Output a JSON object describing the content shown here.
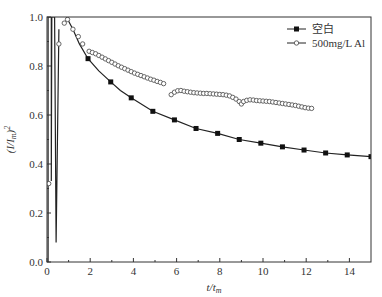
{
  "chart_data": {
    "type": "line",
    "title": "",
    "xlabel": "t/t",
    "xlabel_sub": "m",
    "ylabel": "(I/I",
    "ylabel_sub": "m",
    "ylabel_sup": "2",
    "xlim": [
      0,
      15
    ],
    "ylim": [
      0.0,
      1.0
    ],
    "xticks": [
      0,
      2,
      4,
      6,
      8,
      10,
      12,
      14
    ],
    "xtick_labels": [
      "0",
      "2",
      "4",
      "6",
      "8",
      "10",
      "12",
      "14"
    ],
    "yticks": [
      0.0,
      0.2,
      0.4,
      0.6,
      0.8,
      1.0
    ],
    "ytick_labels": [
      "0.0",
      "0.2",
      "0.4",
      "0.6",
      "0.8",
      "1.0"
    ],
    "grid": false,
    "legend_position": "upper right",
    "series": [
      {
        "name": "空白",
        "marker": "filled-square",
        "line": "solid-curve",
        "points": [
          [
            1.9,
            0.83
          ],
          [
            2.95,
            0.735
          ],
          [
            3.9,
            0.67
          ],
          [
            4.9,
            0.615
          ],
          [
            5.9,
            0.58
          ],
          [
            6.9,
            0.545
          ],
          [
            7.9,
            0.525
          ],
          [
            8.9,
            0.5
          ],
          [
            9.9,
            0.485
          ],
          [
            10.9,
            0.47
          ],
          [
            11.9,
            0.457
          ],
          [
            12.9,
            0.445
          ],
          [
            13.9,
            0.437
          ],
          [
            15.0,
            0.43
          ]
        ],
        "curve": [
          [
            0.9,
            1.0
          ],
          [
            1.2,
            0.95
          ],
          [
            1.5,
            0.89
          ],
          [
            1.9,
            0.83
          ],
          [
            2.4,
            0.78
          ],
          [
            2.95,
            0.735
          ],
          [
            3.4,
            0.7
          ],
          [
            3.9,
            0.67
          ],
          [
            4.9,
            0.615
          ],
          [
            5.9,
            0.58
          ],
          [
            6.9,
            0.545
          ],
          [
            7.9,
            0.525
          ],
          [
            8.9,
            0.5
          ],
          [
            9.9,
            0.485
          ],
          [
            10.9,
            0.47
          ],
          [
            11.9,
            0.457
          ],
          [
            12.9,
            0.445
          ],
          [
            13.9,
            0.437
          ],
          [
            15.0,
            0.43
          ]
        ],
        "initial_transient": [
          [
            0.05,
            0.0
          ],
          [
            0.05,
            1.0
          ],
          [
            0.2,
            1.0
          ],
          [
            0.2,
            0.33
          ],
          [
            0.22,
            1.0
          ],
          [
            0.35,
            1.0
          ],
          [
            0.42,
            0.08
          ],
          [
            0.55,
            0.95
          ]
        ]
      },
      {
        "name": "500mg/L Al",
        "marker": "open-circle",
        "line": "none",
        "points": [
          [
            0.08,
            0.32
          ],
          [
            0.55,
            0.89
          ],
          [
            0.8,
            0.975
          ],
          [
            0.95,
            0.99
          ],
          [
            1.2,
            0.95
          ],
          [
            1.45,
            0.92
          ],
          [
            1.65,
            0.89
          ],
          [
            1.95,
            0.86
          ],
          [
            2.1,
            0.855
          ],
          [
            2.25,
            0.85
          ],
          [
            2.4,
            0.843
          ],
          [
            2.55,
            0.836
          ],
          [
            2.7,
            0.829
          ],
          [
            2.85,
            0.822
          ],
          [
            3.0,
            0.815
          ],
          [
            3.15,
            0.808
          ],
          [
            3.3,
            0.801
          ],
          [
            3.45,
            0.795
          ],
          [
            3.6,
            0.789
          ],
          [
            3.75,
            0.783
          ],
          [
            3.9,
            0.777
          ],
          [
            4.05,
            0.771
          ],
          [
            4.2,
            0.766
          ],
          [
            4.35,
            0.761
          ],
          [
            4.5,
            0.756
          ],
          [
            4.65,
            0.751
          ],
          [
            4.8,
            0.746
          ],
          [
            4.95,
            0.742
          ],
          [
            5.1,
            0.737
          ],
          [
            5.25,
            0.733
          ],
          [
            5.4,
            0.728
          ],
          [
            5.75,
            0.683
          ],
          [
            5.9,
            0.693
          ],
          [
            6.05,
            0.699
          ],
          [
            6.2,
            0.7
          ],
          [
            6.35,
            0.697
          ],
          [
            6.5,
            0.695
          ],
          [
            6.65,
            0.693
          ],
          [
            6.8,
            0.691
          ],
          [
            6.95,
            0.69
          ],
          [
            7.1,
            0.689
          ],
          [
            7.25,
            0.688
          ],
          [
            7.4,
            0.688
          ],
          [
            7.55,
            0.687
          ],
          [
            7.7,
            0.686
          ],
          [
            7.85,
            0.685
          ],
          [
            8.0,
            0.684
          ],
          [
            8.15,
            0.683
          ],
          [
            8.3,
            0.681
          ],
          [
            8.45,
            0.678
          ],
          [
            8.6,
            0.672
          ],
          [
            8.75,
            0.665
          ],
          [
            8.9,
            0.655
          ],
          [
            9.0,
            0.645
          ],
          [
            9.1,
            0.655
          ],
          [
            9.25,
            0.66
          ],
          [
            9.4,
            0.662
          ],
          [
            9.55,
            0.661
          ],
          [
            9.7,
            0.659
          ],
          [
            9.85,
            0.658
          ],
          [
            10.0,
            0.657
          ],
          [
            10.15,
            0.656
          ],
          [
            10.3,
            0.655
          ],
          [
            10.45,
            0.653
          ],
          [
            10.6,
            0.651
          ],
          [
            10.75,
            0.649
          ],
          [
            10.9,
            0.647
          ],
          [
            11.05,
            0.645
          ],
          [
            11.2,
            0.643
          ],
          [
            11.35,
            0.641
          ],
          [
            11.5,
            0.639
          ],
          [
            11.65,
            0.636
          ],
          [
            11.8,
            0.633
          ],
          [
            11.95,
            0.63
          ],
          [
            12.1,
            0.628
          ],
          [
            12.25,
            0.627
          ]
        ]
      }
    ]
  },
  "legend": {
    "items": [
      {
        "label": "空白",
        "marker": "filled-square"
      },
      {
        "label": "500mg/L Al",
        "marker": "open-circle"
      }
    ]
  },
  "colors": {
    "axis": "#333333",
    "series_line": "#222222",
    "marker_fill": "#111111",
    "open_marker_stroke": "#555555",
    "background": "#ffffff"
  }
}
